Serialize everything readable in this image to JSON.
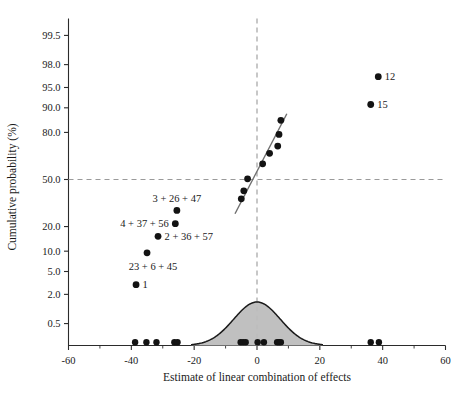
{
  "chart_data": {
    "type": "scatter",
    "title": "",
    "subtitle": "",
    "xlabel": "Estimate of linear combination of effects",
    "ylabel": "Cumulative probability (%)",
    "xlim": [
      -60,
      60
    ],
    "ylim_percent": [
      0.1,
      99.9
    ],
    "grid": false,
    "legend_position": "none",
    "y_scale": "normal-probability",
    "x_ticks": [
      -60,
      -40,
      -20,
      0,
      20,
      40,
      60
    ],
    "x_tick_labels": [
      "-60",
      "-40",
      "-20",
      "0",
      "20",
      "40",
      "60"
    ],
    "x_minor_ticks": [
      -50,
      -30,
      -10,
      10,
      30,
      50
    ],
    "y_ticks_percent": [
      99.5,
      98.0,
      95.0,
      90.0,
      80.0,
      50.0,
      20.0,
      10.0,
      5.0,
      2.0,
      0.5
    ],
    "y_tick_labels": [
      "99.5",
      "98.0",
      "95.0",
      "90.0",
      "80.0",
      "50.0",
      "20.0",
      "10.0",
      "5.0",
      "2.0",
      "0.5"
    ],
    "reference_lines": [
      {
        "orientation": "horizontal",
        "value_percent": 50.0,
        "style": "dashed",
        "color": "#9a9a9a"
      },
      {
        "orientation": "vertical",
        "value": 0,
        "style": "dashed",
        "color": "#9a9a9a"
      }
    ],
    "fit_line": {
      "label": "reference fit line",
      "x_start": -7.0,
      "y_start_percent": 27.0,
      "x_end": 9.5,
      "y_end_percent": 88.0,
      "color": "#6f6f6f"
    },
    "points": [
      {
        "x": -38.5,
        "y_percent": 3.0,
        "label": "1",
        "label_pos": "right"
      },
      {
        "x": -35.0,
        "y_percent": 9.5,
        "label": "23 + 6 + 45",
        "label_pos": "below"
      },
      {
        "x": -31.5,
        "y_percent": 15.5,
        "label": "2 + 36 + 57",
        "label_pos": "right"
      },
      {
        "x": -26.0,
        "y_percent": 21.5,
        "label": "4 + 37 + 56",
        "label_pos": "left"
      },
      {
        "x": -25.5,
        "y_percent": 29.0,
        "label": "3 + 26 + 47",
        "label_pos": "above"
      },
      {
        "x": -5.0,
        "y_percent": 36.5,
        "label": "",
        "label_pos": ""
      },
      {
        "x": -4.2,
        "y_percent": 42.0,
        "label": "",
        "label_pos": ""
      },
      {
        "x": -3.0,
        "y_percent": 50.5,
        "label": "",
        "label_pos": ""
      },
      {
        "x": 1.8,
        "y_percent": 61.0,
        "label": "",
        "label_pos": ""
      },
      {
        "x": 4.0,
        "y_percent": 68.0,
        "label": "",
        "label_pos": ""
      },
      {
        "x": 6.6,
        "y_percent": 72.5,
        "label": "",
        "label_pos": ""
      },
      {
        "x": 7.0,
        "y_percent": 79.0,
        "label": "",
        "label_pos": ""
      },
      {
        "x": 7.6,
        "y_percent": 85.5,
        "label": "",
        "label_pos": ""
      },
      {
        "x": 36.2,
        "y_percent": 91.0,
        "label": "15",
        "label_pos": "right"
      },
      {
        "x": 38.6,
        "y_percent": 96.7,
        "label": "12",
        "label_pos": "right"
      }
    ],
    "rug_points_x": [
      -38.8,
      -35.2,
      -32.0,
      -26.3,
      -25.3,
      -5.2,
      -4.4,
      -3.6,
      0.2,
      2.2,
      6.4,
      7.0,
      7.6,
      36.2,
      38.8
    ],
    "density_curve": {
      "description": "fitted normal density of effect estimates drawn along the bottom axis",
      "mean": 0,
      "sd": 7.4,
      "x_min": -21,
      "x_max": 21,
      "fill_color": "#bdbdbd",
      "stroke_color": "#1a1a1a"
    },
    "annotations": [
      {
        "text": "3 + 26 + 47",
        "refers_to_point_x": -25.5
      },
      {
        "text": "4 + 37 + 56",
        "refers_to_point_x": -26.0
      },
      {
        "text": "2 + 36 + 57",
        "refers_to_point_x": -31.5
      },
      {
        "text": "23 + 6 + 45",
        "refers_to_point_x": -35.0
      },
      {
        "text": "1",
        "refers_to_point_x": -38.5
      },
      {
        "text": "15",
        "refers_to_point_x": 36.2
      },
      {
        "text": "12",
        "refers_to_point_x": 38.6
      }
    ]
  }
}
